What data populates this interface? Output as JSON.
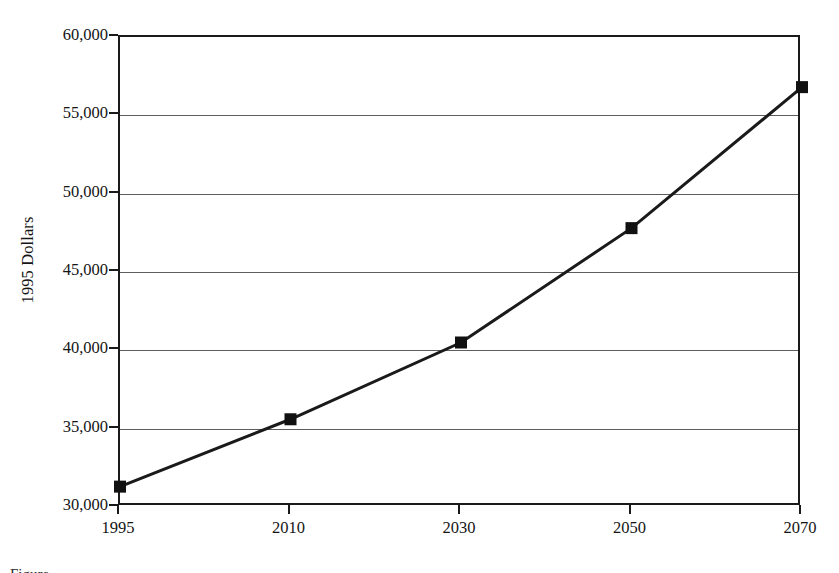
{
  "figure": {
    "background_color": "#ffffff",
    "ink_color": "#1a1a1a",
    "caption_partial": "Figure"
  },
  "chart_data": {
    "type": "line",
    "title": "",
    "xlabel": "",
    "ylabel": "1995 Dollars",
    "categories": [
      "1995",
      "2010",
      "2030",
      "2050",
      "2070"
    ],
    "values": [
      31300,
      35600,
      40500,
      47800,
      56800
    ],
    "series": [
      {
        "name": "1995 Dollars",
        "values": [
          31300,
          35600,
          40500,
          47800,
          56800
        ]
      }
    ],
    "ylim": [
      30000,
      60000
    ],
    "ytick_values": [
      60000,
      55000,
      50000,
      45000,
      40000,
      35000,
      30000
    ],
    "ytick_labels": [
      "60,000",
      "55,000",
      "50,000",
      "45,000",
      "40,000",
      "35,000",
      "30,000"
    ],
    "xtick_labels": [
      "1995",
      "2010",
      "2030",
      "2050",
      "2070"
    ],
    "grid": "horizontal",
    "gridline_color": "#5d5d5d",
    "legend": "none",
    "marker": "filled-square",
    "marker_color": "#111111",
    "marker_size_px": 12,
    "line_color": "#1a1a1a",
    "line_width_px": 3,
    "plot_border": true,
    "annotations": []
  }
}
